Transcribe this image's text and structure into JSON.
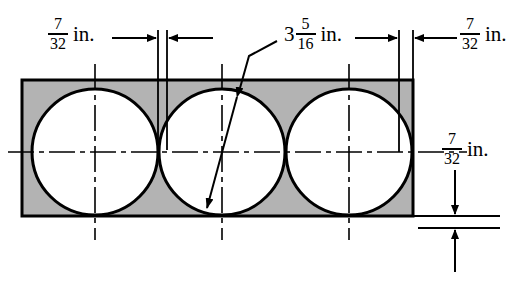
{
  "figure": {
    "units": "in.",
    "colors": {
      "plate_fill": "#b3b3b3",
      "hole_fill": "#ffffff",
      "outline": "#000000",
      "background": "#ffffff"
    }
  },
  "dimensions": [
    {
      "id": "left-margin",
      "whole": "",
      "numerator": "7",
      "denominator": "32",
      "unit": "in.",
      "position": "top-left",
      "describes": "distance from left edge of plate to first hole edge"
    },
    {
      "id": "hole-diameter",
      "whole": "3",
      "numerator": "5",
      "denominator": "16",
      "unit": "in.",
      "position": "top-center",
      "describes": "diameter of each circular hole"
    },
    {
      "id": "right-margin",
      "whole": "",
      "numerator": "7",
      "denominator": "32",
      "unit": "in.",
      "position": "top-right",
      "describes": "distance from third hole edge to right edge of plate"
    },
    {
      "id": "bottom-margin",
      "whole": "",
      "numerator": "7",
      "denominator": "32",
      "unit": "in.",
      "position": "right-middle",
      "describes": "distance from hole edge to bottom edge of plate"
    }
  ],
  "plate": {
    "x": 22,
    "y": 80,
    "width": 391,
    "height": 136
  },
  "holes": [
    {
      "id": "hole-1",
      "cx": 95,
      "cy": 152,
      "r": 63
    },
    {
      "id": "hole-2",
      "cx": 222,
      "cy": 152,
      "r": 63
    },
    {
      "id": "hole-3",
      "cx": 349,
      "cy": 152,
      "r": 63
    }
  ]
}
